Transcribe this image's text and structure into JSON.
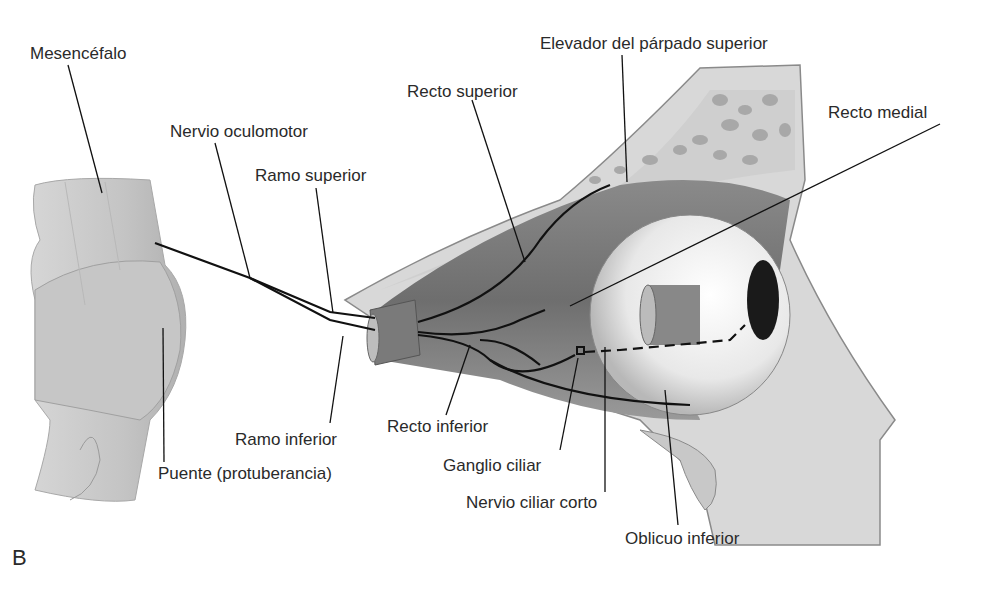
{
  "figure": {
    "panel_letter": "B",
    "labels": {
      "mesencefalo": "Mesencéfalo",
      "nervio_oculomotor": "Nervio oculomotor",
      "ramo_superior": "Ramo superior",
      "recto_superior": "Recto superior",
      "elevador": "Elevador del párpado superior",
      "recto_medial": "Recto medial",
      "ramo_inferior": "Ramo inferior",
      "puente": "Puente (protuberancia)",
      "recto_inferior": "Recto inferior",
      "ganglio_ciliar": "Ganglio ciliar",
      "nervio_ciliar_corto": "Nervio ciliar corto",
      "oblicuo_inferior": "Oblicuo inferior"
    }
  }
}
